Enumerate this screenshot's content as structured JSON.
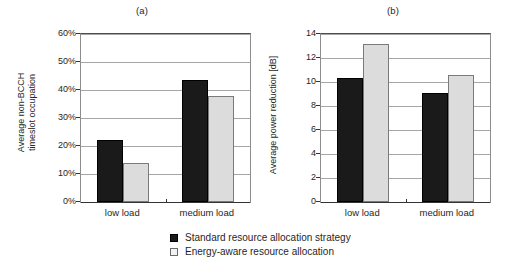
{
  "chart_data": [
    {
      "type": "bar",
      "panel": "(a)",
      "title": "",
      "xlabel": "",
      "ylabel_line1": "Average non-BCCH",
      "ylabel_line2": "timeslot occupation",
      "categories": [
        "low load",
        "medium load"
      ],
      "ylim": [
        0,
        60
      ],
      "yticks": [
        "0%",
        "10%",
        "20%",
        "30%",
        "40%",
        "50%",
        "60%"
      ],
      "ytick_values": [
        0,
        10,
        20,
        30,
        40,
        50,
        60
      ],
      "grid": true,
      "legend_position": "bottom-center-outside",
      "series": [
        {
          "name": "Standard resource allocation strategy",
          "color": "#1a1a1a",
          "values": [
            22,
            43.5
          ]
        },
        {
          "name": "Energy-aware resource allocation",
          "color": "#dcdcdc",
          "values": [
            14,
            38
          ]
        }
      ]
    },
    {
      "type": "bar",
      "panel": "(b)",
      "title": "",
      "xlabel": "",
      "ylabel_line1": "Average power reduction [dB]",
      "ylabel_line2": "",
      "categories": [
        "low load",
        "medium load"
      ],
      "ylim": [
        0,
        14
      ],
      "yticks": [
        "0",
        "2",
        "4",
        "6",
        "8",
        "10",
        "12",
        "14"
      ],
      "ytick_values": [
        0,
        2,
        4,
        6,
        8,
        10,
        12,
        14
      ],
      "grid": true,
      "legend_position": "bottom-center-outside",
      "series": [
        {
          "name": "Standard resource allocation strategy",
          "color": "#1a1a1a",
          "values": [
            10.3,
            9.1
          ]
        },
        {
          "name": "Energy-aware resource allocation",
          "color": "#dcdcdc",
          "values": [
            13.2,
            10.6
          ]
        }
      ]
    }
  ],
  "legend": {
    "items": [
      {
        "label": "Standard resource allocation strategy",
        "marker": "filled-square"
      },
      {
        "label": "Energy-aware resource allocation",
        "marker": "open-square"
      }
    ]
  }
}
